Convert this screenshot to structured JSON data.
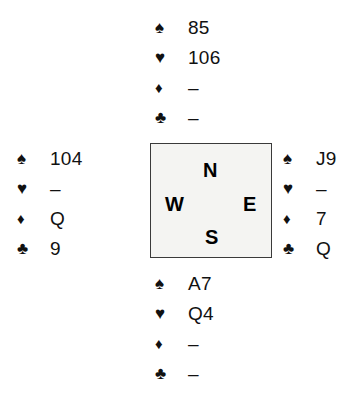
{
  "diagram": {
    "type": "bridge-deal-diagram",
    "suit_order": [
      "spade",
      "heart",
      "diamond",
      "club"
    ],
    "suit_symbols": {
      "spade": "♠",
      "heart": "♥",
      "diamond": "♦",
      "club": "♣"
    },
    "void_mark": "–",
    "symbol_color": "#111111",
    "box_fill": "#f4f4f2",
    "box_border": "#3a3a3a",
    "background": "#ffffff"
  },
  "compass": {
    "north": "N",
    "west": "W",
    "east": "E",
    "south": "S"
  },
  "hands": {
    "north": {
      "position_label": "North",
      "spades": "85",
      "hearts": "106",
      "diamonds": "–",
      "clubs": "–"
    },
    "west": {
      "position_label": "West",
      "spades": "104",
      "hearts": "–",
      "diamonds": "Q",
      "clubs": "9"
    },
    "east": {
      "position_label": "East",
      "spades": "J9",
      "hearts": "–",
      "diamonds": "7",
      "clubs": "Q"
    },
    "south": {
      "position_label": "South",
      "spades": "A7",
      "hearts": "Q4",
      "diamonds": "–",
      "clubs": "–"
    }
  }
}
